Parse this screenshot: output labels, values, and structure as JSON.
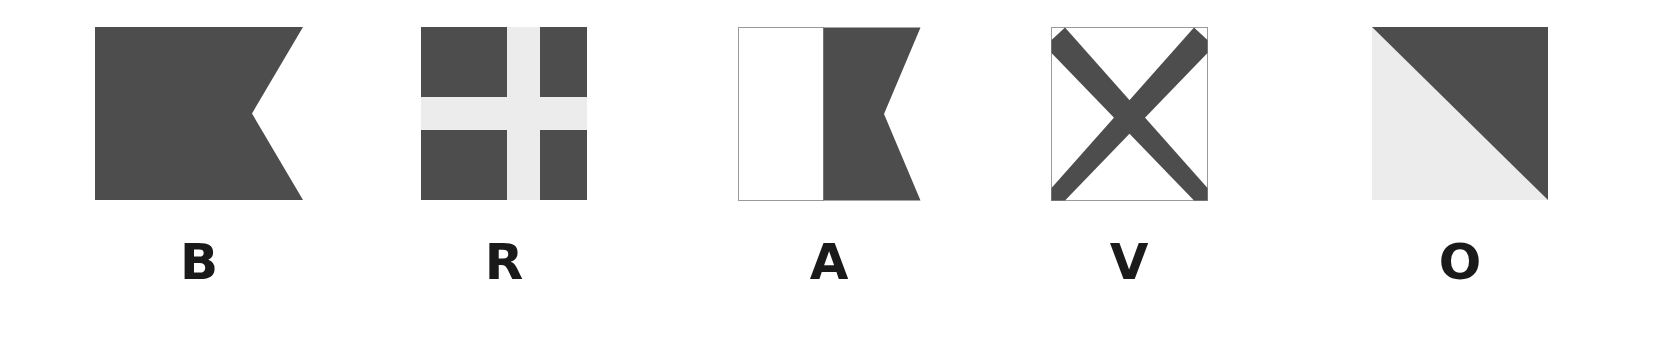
{
  "page": {
    "background_color": "#ffffff",
    "width": 1678,
    "height": 344
  },
  "palette": {
    "dark": "#4d4d4d",
    "light": "#ececec",
    "white": "#ffffff",
    "outline": "#9a9a9a",
    "label": "#1a1a1a"
  },
  "spelled_word": "BRAVO",
  "flags": [
    {
      "letter": "B",
      "name": "flag-bravo",
      "shape": "swallowtail-pennant",
      "description": "Solid dark swallowtail pennant",
      "x": 95,
      "y": 27,
      "width": 208,
      "height": 173,
      "notch_depth": 51,
      "colors": [
        "#4d4d4d"
      ]
    },
    {
      "letter": "R",
      "name": "flag-romeo",
      "shape": "greek-cross-rectangle",
      "description": "Dark rectangle with light upright cross",
      "x": 421,
      "y": 27,
      "width": 166,
      "height": 173,
      "cross_band_width": 33,
      "colors": [
        "#4d4d4d",
        "#ececec"
      ]
    },
    {
      "letter": "A",
      "name": "flag-alfa",
      "shape": "vertical-bicolour-swallowtail",
      "description": "White hoist half and dark swallowtail fly half",
      "x": 738,
      "y": 27,
      "width": 182,
      "height": 173,
      "split_offset": 85,
      "notch_depth": 36,
      "colors": [
        "#ffffff",
        "#4d4d4d"
      ]
    },
    {
      "letter": "V",
      "name": "flag-victor",
      "shape": "saltire-rectangle",
      "description": "White rectangle with dark saltire cross",
      "x": 1051,
      "y": 27,
      "width": 156,
      "height": 173,
      "stroke_width": 26,
      "colors": [
        "#ffffff",
        "#4d4d4d"
      ]
    },
    {
      "letter": "O",
      "name": "flag-oscar",
      "shape": "diagonal-bicolour-rectangle",
      "description": "Rectangle split on the diagonal, dark above, light below",
      "x": 1372,
      "y": 27,
      "width": 176,
      "height": 173,
      "colors": [
        "#4d4d4d",
        "#ececec"
      ]
    }
  ]
}
